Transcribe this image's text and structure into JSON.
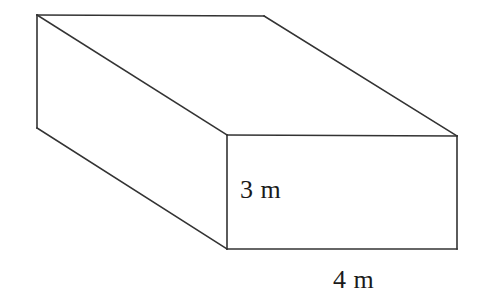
{
  "figure": {
    "name": "rectangular-prism",
    "canvas": {
      "width": 484,
      "height": 305
    },
    "background_color": "#ffffff",
    "line_color": "#333333",
    "line_width": 1.6,
    "vertices": {
      "back_top_left": {
        "x": 37,
        "y": 15
      },
      "back_top_right": {
        "x": 264,
        "y": 16
      },
      "back_bottom_left": {
        "x": 37,
        "y": 128
      },
      "front_top_left": {
        "x": 227,
        "y": 135
      },
      "front_top_right": {
        "x": 457,
        "y": 136
      },
      "front_bottom_left": {
        "x": 227,
        "y": 249
      },
      "front_bottom_right": {
        "x": 457,
        "y": 249
      }
    },
    "edges": [
      {
        "name": "back-top-horizontal-edge",
        "from": "back_top_left",
        "to": "back_top_right"
      },
      {
        "name": "back-left-vertical-edge",
        "from": "back_top_left",
        "to": "back_bottom_left"
      },
      {
        "name": "top-left-diagonal-edge",
        "from": "back_top_left",
        "to": "front_top_left"
      },
      {
        "name": "top-right-diagonal-edge",
        "from": "back_top_right",
        "to": "front_top_right"
      },
      {
        "name": "bottom-left-diagonal-edge",
        "from": "back_bottom_left",
        "to": "front_bottom_left"
      },
      {
        "name": "front-top-horizontal-edge",
        "from": "front_top_left",
        "to": "front_top_right"
      },
      {
        "name": "front-left-vertical-edge",
        "from": "front_top_left",
        "to": "front_bottom_left"
      },
      {
        "name": "front-right-vertical-edge",
        "from": "front_top_right",
        "to": "front_bottom_right"
      },
      {
        "name": "front-bottom-horizontal-edge",
        "from": "front_bottom_left",
        "to": "front_bottom_right"
      }
    ]
  },
  "labels": {
    "height": {
      "text": "3 m",
      "value": 3,
      "unit": "m",
      "measures": "front-left-vertical-edge",
      "x": 240,
      "y": 198,
      "font_size": 26
    },
    "width": {
      "text": "4 m",
      "value": 4,
      "unit": "m",
      "measures": "front-bottom-horizontal-edge",
      "x": 333,
      "y": 288,
      "font_size": 26
    }
  }
}
